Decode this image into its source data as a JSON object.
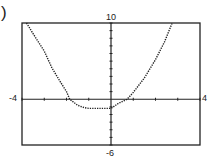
{
  "panel_label": ")",
  "chart_data": {
    "type": "line",
    "title": "",
    "xlabel": "",
    "ylabel": "",
    "xlim": [
      -4,
      4
    ],
    "ylim": [
      -6,
      10
    ],
    "xscale_ticks": 1,
    "yscale_ticks": 1,
    "grid": false,
    "legend": "none",
    "window_labels": {
      "xmin": "-4",
      "xmax": "4",
      "ymin": "-6",
      "ymax": "10"
    },
    "series": [
      {
        "name": "graph",
        "style": "dotted",
        "x": [
          -3.8,
          -3.5,
          -3.0,
          -2.65,
          -2.3,
          -2.0,
          -1.85,
          -1.5,
          -1.2,
          -1.0,
          -0.5,
          0.0,
          0.3,
          0.72,
          1.0,
          1.5,
          2.0,
          2.4,
          2.75
        ],
        "y": [
          10.0,
          8.6,
          6.3,
          4.1,
          2.4,
          1.0,
          0.0,
          -0.8,
          -1.1,
          -1.2,
          -1.2,
          -1.2,
          -0.6,
          0.0,
          0.9,
          2.8,
          5.2,
          7.5,
          10.0
        ]
      }
    ]
  }
}
